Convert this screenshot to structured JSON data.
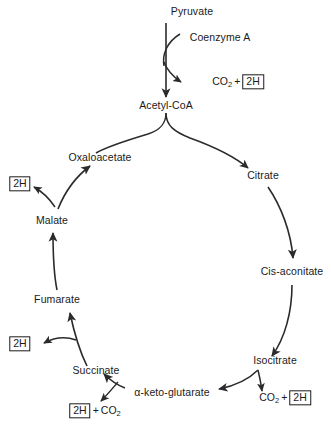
{
  "diagram": {
    "background_color": "#ffffff",
    "stroke_color": "#2b2b2b",
    "text_color": "#1a1a1a"
  },
  "entry_pathway": {
    "start": "Pyruvate",
    "cofactor": "Coenzyme A",
    "byproduct_co2": "CO",
    "byproduct_co2_sub": "2",
    "byproduct_plus": "+",
    "byproduct_2h": "2H",
    "end": "Acetyl-CoA"
  },
  "cycle": {
    "direction": "counterclockwise",
    "nodes": [
      {
        "id": "oxaloacetate",
        "label": "Oxaloacetate"
      },
      {
        "id": "citrate",
        "label": "Citrate"
      },
      {
        "id": "cis-aconitate",
        "label": "Cis-aconitate"
      },
      {
        "id": "isocitrate",
        "label": "Isocitrate"
      },
      {
        "id": "alpha-keto-glutarate",
        "label": "α-keto-glutarate"
      },
      {
        "id": "succinate",
        "label": "Succinate"
      },
      {
        "id": "fumarate",
        "label": "Fumarate"
      },
      {
        "id": "malate",
        "label": "Malate"
      }
    ]
  },
  "byproducts": {
    "malate_2h": "2H",
    "fumarate_2h": "2H",
    "succinate_2h": "2H",
    "succinate_plus": "+",
    "succinate_co2": "CO",
    "succinate_co2_sub": "2",
    "isocitrate_co2": "CO",
    "isocitrate_co2_sub": "2",
    "isocitrate_plus": "+",
    "isocitrate_2h": "2H"
  }
}
